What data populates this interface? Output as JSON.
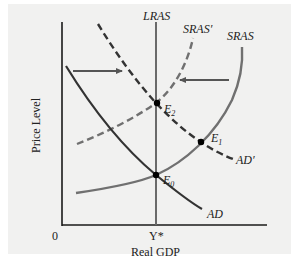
{
  "diagram": {
    "type": "AD-AS model",
    "x_axis_label": "Real GDP",
    "y_axis_label": "Price Level",
    "origin_label": "0",
    "x_tick_label": "Y*",
    "curves": {
      "lras": "LRAS",
      "sras": "SRAS",
      "sras_prime": "SRAS′",
      "ad": "AD",
      "ad_prime": "AD′"
    },
    "points": {
      "e0": "E",
      "e0_sub": "0",
      "e1": "E",
      "e1_sub": "1",
      "e2": "E",
      "e2_sub": "2"
    },
    "arrows": [
      {
        "label": "AD shift right",
        "direction": "right"
      },
      {
        "label": "SRAS shift left",
        "direction": "left"
      }
    ],
    "colors": {
      "background": "#f1f1f0",
      "axis": "#1a1a1a",
      "ad_curve": "#333333",
      "sras_curve": "#6a6a6a",
      "arrow": "#555555",
      "point": "#000000"
    }
  }
}
